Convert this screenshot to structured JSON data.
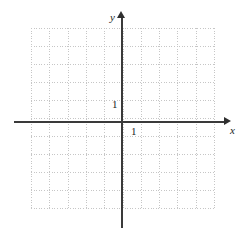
{
  "figure": {
    "width": 245,
    "height": 235,
    "background_color": "#ffffff"
  },
  "chart_data": {
    "type": "scatter",
    "title": "",
    "xlabel": "x",
    "ylabel": "y",
    "x": [],
    "y": [],
    "series": [],
    "xlim": [
      -5,
      5
    ],
    "ylim": [
      -5,
      5
    ],
    "xticks": [
      1
    ],
    "yticks": [
      1
    ],
    "xtick_labels": [
      "1"
    ],
    "ytick_labels": [
      "1"
    ],
    "grid": true,
    "grid_style": "dotted",
    "grid_color": "#c6c6c6",
    "grid_columns": 10,
    "grid_rows": 10,
    "axis_color": "#3a3a3a",
    "axis_arrows": true,
    "legend": null,
    "annotations": []
  },
  "axes": {
    "x_label": "x",
    "y_label": "y",
    "x_tick_one": "1",
    "y_tick_one": "1"
  }
}
